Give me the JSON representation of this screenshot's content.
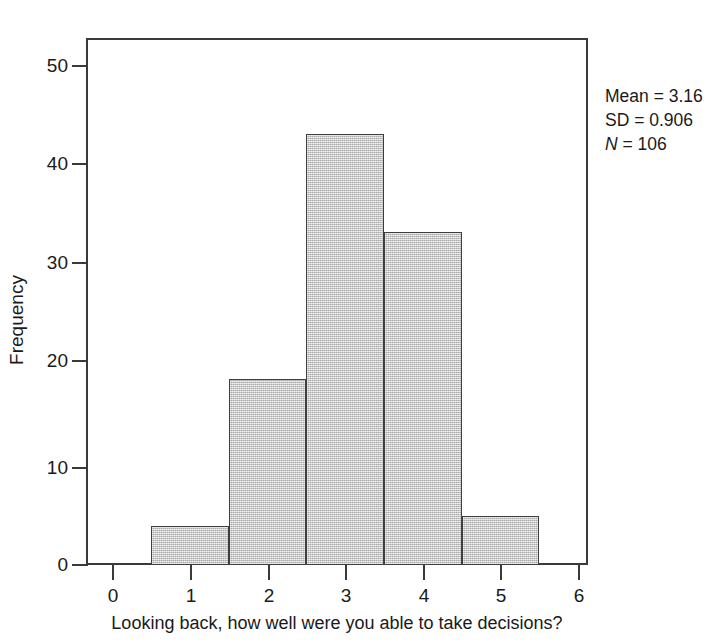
{
  "chart_data": {
    "type": "bar",
    "title": "",
    "subtitle": "",
    "xlabel": "Looking back, how well were you able to take decisions?",
    "ylabel": "Frequency",
    "categories": [
      "1",
      "2",
      "3",
      "4",
      "5"
    ],
    "values": [
      4,
      19,
      44,
      34,
      5
    ],
    "bin_edges": [
      0.5,
      1.5,
      2.5,
      3.5,
      4.5,
      5.5
    ],
    "bin_width": 1,
    "x_ticks": [
      0,
      1,
      2,
      3,
      4,
      5,
      6
    ],
    "x_tick_labels": [
      "0",
      "1",
      "2",
      "3",
      "4",
      "5",
      "6"
    ],
    "y_ticks": [
      0,
      10,
      20,
      30,
      40,
      50
    ],
    "y_tick_labels": [
      "0",
      "10",
      "20",
      "30",
      "40",
      "50"
    ],
    "xlim": [
      -0.35,
      6.1
    ],
    "ylim": [
      0,
      54
    ],
    "grid": false,
    "legend": null,
    "bar_fill_color": "#c0c0c0",
    "bar_edge_color": "#3f3f3f",
    "axis_color": "#3a3a3a",
    "background_color": "#ffffff",
    "annotations": {
      "mean_label": "Mean = 3.16",
      "sd_label": "SD = 0.906",
      "n_symbol": "N",
      "n_value": " = 106",
      "position": "top-right-outside"
    }
  }
}
